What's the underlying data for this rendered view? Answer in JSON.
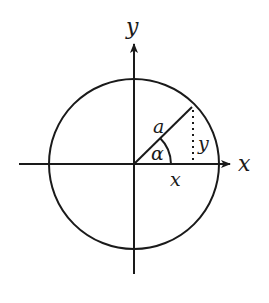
{
  "diagram": {
    "type": "unit-circle-trigonometry",
    "stroke_color": "#1a1a1a",
    "background": "#ffffff",
    "labels": {
      "y_axis": "y",
      "x_axis": "x",
      "radius": "a",
      "angle": "α",
      "vertical_leg": "y",
      "horizontal_leg": "x"
    },
    "geometry": {
      "center": [
        134,
        164
      ],
      "radius": 85,
      "point_on_circle": [
        192,
        107
      ],
      "x_axis": {
        "from": 19,
        "to": 232
      },
      "y_axis": {
        "from": 274,
        "to": 42
      },
      "angle_arc_radius": 18
    }
  }
}
